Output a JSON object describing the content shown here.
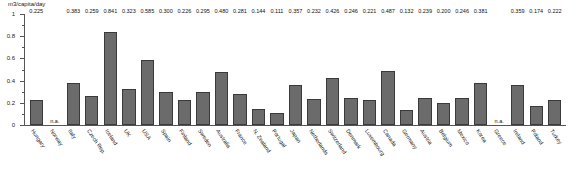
{
  "chart_data": {
    "type": "bar",
    "title": "",
    "subtitle": "",
    "xlabel": "",
    "ylabel": "m3/capita/day",
    "ylim": [
      0,
      1
    ],
    "yticks": [
      "0",
      "0.2",
      "0.4",
      "0.6",
      "0.8",
      "1"
    ],
    "grid": false,
    "legend": null,
    "na_text": "n.a.",
    "bar_color": "#6b6b6b",
    "categories": [
      "Hungary",
      "Norway",
      "Italy",
      "Czech Rep.",
      "Iceland",
      "UK",
      "USA",
      "Spain",
      "Finland",
      "Sweden",
      "Australia",
      "France",
      "N. Zealand",
      "Portugal",
      "Japan",
      "Netherlands",
      "Switzerland",
      "Denmark",
      "Luxembourg",
      "Canada",
      "Germany",
      "Austria",
      "Belgium",
      "Mexico",
      "Korea",
      "Greece",
      "Ireland",
      "Poland",
      "Turkey"
    ],
    "values": [
      0.225,
      null,
      0.383,
      0.259,
      0.841,
      0.323,
      0.585,
      0.3,
      0.226,
      0.295,
      0.48,
      0.281,
      0.144,
      0.111,
      0.357,
      0.232,
      0.426,
      0.246,
      0.221,
      0.487,
      0.132,
      0.239,
      0.2,
      0.246,
      0.381,
      null,
      0.359,
      0.174,
      0.222
    ],
    "labels": [
      "0.225",
      "n.a.",
      "0.383",
      "0.259",
      "0.841",
      "0.323",
      "0.585",
      "0.300",
      "0.226",
      "0.295",
      "0.480",
      "0.281",
      "0.144",
      "0.111",
      "0.357",
      "0.232",
      "0.426",
      "0.246",
      "0.221",
      "0.487",
      "0.132",
      "0.239",
      "0.200",
      "0.246",
      "0.381",
      "n.a.",
      "0.359",
      "0.174",
      "0.222"
    ]
  }
}
